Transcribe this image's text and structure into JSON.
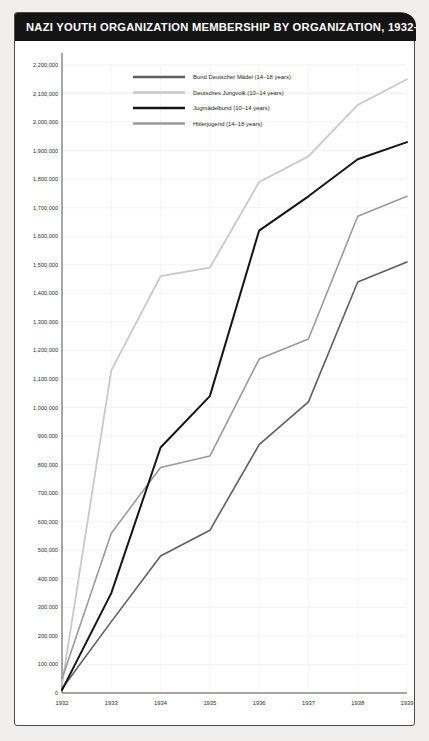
{
  "header": {
    "title": "NAZI YOUTH ORGANIZATION MEMBERSHIP BY ORGANIZATION, 1932–39"
  },
  "colors": {
    "title_bar": "#141414",
    "card_background": "#ffffff",
    "page_background": "#f0efed",
    "grid": "#e7e5ef",
    "axis": "#3a3a3a",
    "series_bdm": "#5f5f5f",
    "series_dj": "#c9c9c9",
    "series_jm": "#151515",
    "series_hj": "#9a9a9a"
  },
  "chart_data": {
    "type": "line",
    "title": "NAZI YOUTH ORGANIZATION MEMBERSHIP BY ORGANIZATION, 1932–39",
    "xlabel": "",
    "ylabel": "",
    "x": [
      1932,
      1933,
      1934,
      1935,
      1936,
      1937,
      1938,
      1939
    ],
    "categories": [
      "1932",
      "1933",
      "1934",
      "1935",
      "1936",
      "1937",
      "1938",
      "1939"
    ],
    "xlim": [
      1932,
      1939
    ],
    "ylim": [
      0,
      2200000
    ],
    "ytick_step": 100000,
    "yticks": [
      "0",
      "100,000",
      "200,000",
      "300,000",
      "400,000",
      "500,000",
      "600,000",
      "700,000",
      "800,000",
      "900,000",
      "1,000,000",
      "1,100,000",
      "1,200,000",
      "1,300,000",
      "1,400,000",
      "1,500,000",
      "1,600,000",
      "1,700,000",
      "1,800,000",
      "1,900,000",
      "2,000,000",
      "2,100,000",
      "2,200,000"
    ],
    "grid": true,
    "legend_position": "top-center",
    "series": [
      {
        "name": "Bund Deutscher Mädel (14–18 years)",
        "color": "#5f5f5f",
        "width": 1.6,
        "values": [
          15000,
          250000,
          480000,
          570000,
          870000,
          1020000,
          1440000,
          1510000
        ]
      },
      {
        "name": "Deutsches Jungvolk (10–14 years)",
        "color": "#c9c9c9",
        "width": 1.8,
        "values": [
          30000,
          1130000,
          1460000,
          1490000,
          1790000,
          1880000,
          2060000,
          2150000
        ]
      },
      {
        "name": "Jugmädelbund (10–14 years)",
        "color": "#151515",
        "width": 2.0,
        "values": [
          10000,
          350000,
          860000,
          1040000,
          1620000,
          1740000,
          1870000,
          1930000
        ]
      },
      {
        "name": "Hitlerjugend (14–18 years)",
        "color": "#9a9a9a",
        "width": 1.6,
        "values": [
          50000,
          560000,
          790000,
          830000,
          1170000,
          1240000,
          1670000,
          1740000
        ]
      }
    ]
  }
}
